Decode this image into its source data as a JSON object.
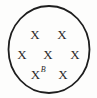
{
  "figure": {
    "type": "set-diagram",
    "background_color": "#fdfdfc",
    "stroke_color": "#1e1e1e",
    "text_color": "#2a2a2a",
    "boundary": {
      "name": "enclosing-circle",
      "shape": "ellipse",
      "cx": 49,
      "cy": 49.5,
      "rx": 40.5,
      "ry": 43.5,
      "stroke_width": 1.8,
      "fill": "none"
    },
    "marker_glyph": "X",
    "points": [
      {
        "id": "p1",
        "glyph": "X",
        "label": "",
        "x": 35,
        "y": 34
      },
      {
        "id": "p2",
        "glyph": "X",
        "label": "",
        "x": 62,
        "y": 34
      },
      {
        "id": "p3",
        "glyph": "X",
        "label": "",
        "x": 22,
        "y": 54
      },
      {
        "id": "p4",
        "glyph": "X",
        "label": "",
        "x": 48,
        "y": 54
      },
      {
        "id": "p5",
        "glyph": "X",
        "label": "",
        "x": 75,
        "y": 54
      },
      {
        "id": "p6",
        "glyph": "X",
        "label": "B",
        "x": 38,
        "y": 74
      },
      {
        "id": "p7",
        "glyph": "X",
        "label": "",
        "x": 63,
        "y": 74
      }
    ]
  }
}
